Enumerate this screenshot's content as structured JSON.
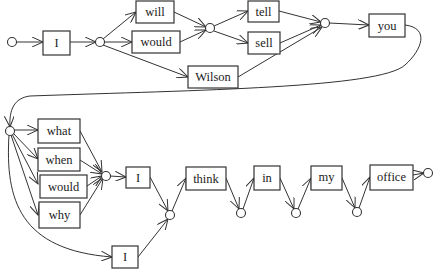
{
  "diagram": {
    "type": "word-lattice",
    "words": {
      "w1": "I",
      "w2": "will",
      "w3": "would",
      "w4": "Wilson",
      "w5": "tell",
      "w6": "sell",
      "w7": "you",
      "w8": "what",
      "w9": "when",
      "w10": "would",
      "w11": "why",
      "w12": "I",
      "w13": "I",
      "w14": "think",
      "w15": "in",
      "w16": "my",
      "w17": "office"
    },
    "sentence_paths": [
      "I will tell you what I think in my office",
      "I would sell you when I think in my office",
      "I Wilson you why I think in my office",
      "I would tell you I think in my office"
    ],
    "colors": {
      "stroke": "#333333",
      "fill": "#ffffff",
      "text": "#222222"
    }
  }
}
